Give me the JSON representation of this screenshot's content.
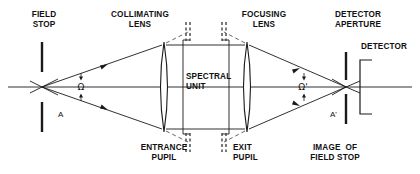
{
  "diagram": {
    "stroke_color": "#1a1a1a",
    "dash_color": "#555555",
    "background": "#ffffff",
    "labels": {
      "field_stop": "FIELD\nSTOP",
      "collimating_lens": "COLLIMATING\nLENS",
      "focusing_lens": "FOCUSING\nLENS",
      "detector_aperture": "DETECTOR\nAPERTURE",
      "detector": "DETECTOR",
      "spectral_unit": "SPECTRAL\nUNIT",
      "entrance_pupil": "ENTRANCE\nPUPIL",
      "exit_pupil": "EXIT\nPUPIL",
      "image_of_field_stop": "IMAGE  OF\nFIELD STOP",
      "solid_angle_in": "Ω",
      "solid_angle_out": "Ω'",
      "area_in": "A",
      "area_out": "A'"
    }
  }
}
